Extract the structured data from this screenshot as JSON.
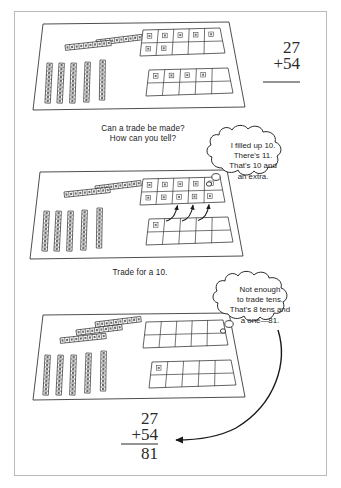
{
  "page": {
    "background": "#ffffff",
    "border_color": "#b9b9b9",
    "ink_color": "#1d1d1d"
  },
  "problem": {
    "addend_top": "27",
    "addend_bottom": "+54",
    "sum": "81",
    "tens_total": "8",
    "ones_total": "1"
  },
  "panels": [
    {
      "id": "panel-start",
      "name": "starting-amount-mat",
      "tens_horizontal": 2,
      "tens_vertical": 5,
      "tens_total": 7,
      "frame_top_units": 7,
      "frame_bottom_units": 4,
      "ones_total": 11,
      "arrows": 0
    },
    {
      "id": "panel-trade",
      "name": "trade-in-progress-mat",
      "tens_horizontal": 2,
      "tens_vertical": 5,
      "tens_total": 7,
      "frame_top_units": 10,
      "frame_bottom_units": 1,
      "ones_total": 11,
      "arrows": 3
    },
    {
      "id": "panel-result",
      "name": "after-trade-mat",
      "tens_horizontal": 3,
      "tens_vertical": 5,
      "tens_total": 8,
      "frame_top_units": 0,
      "frame_bottom_units": 1,
      "ones_total": 1,
      "arrows": 0
    }
  ],
  "captions": {
    "question_line1": "Can a trade be made?",
    "question_line2": "How can you tell?",
    "trade_instruction": "Trade for a 10."
  },
  "bubbles": [
    {
      "id": "bubble-one",
      "name": "thought-bubble-filled-ten",
      "lines": [
        "I filled up 10.",
        "There's 11.",
        "That's 10 and",
        "an extra."
      ]
    },
    {
      "id": "bubble-two",
      "name": "thought-bubble-final-count",
      "lines": [
        "Not enough",
        "to trade tens.",
        "That's 8 tens and",
        "a one—81."
      ]
    }
  ]
}
